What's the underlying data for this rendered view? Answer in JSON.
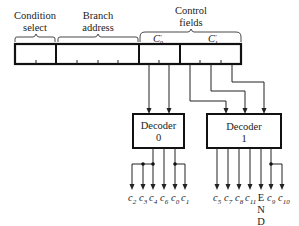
{
  "diagram": {
    "fields": {
      "condition_select": {
        "line1": "Condition",
        "line2": "select"
      },
      "branch_address": {
        "line1": "Branch",
        "line2": "address"
      },
      "control_fields": {
        "line1": "Control",
        "line2": "fields"
      },
      "c0_label": "C",
      "c0_prime": "'",
      "c0_sub": "0",
      "c1_label": "C",
      "c1_prime": "'",
      "c1_sub": "1"
    },
    "decoders": [
      {
        "line1": "Decoder",
        "line2": "0"
      },
      {
        "line1": "Decoder",
        "line2": "1"
      }
    ],
    "decoder0_outputs": [
      {
        "base": "c",
        "sub": "2"
      },
      {
        "base": "c",
        "sub": "3"
      },
      {
        "base": "c",
        "sub": "4"
      },
      {
        "base": "c",
        "sub": "6"
      },
      {
        "base": "c",
        "sub": "0"
      },
      {
        "base": "c",
        "sub": "1"
      }
    ],
    "decoder1_outputs": [
      {
        "base": "c",
        "sub": "5"
      },
      {
        "base": "c",
        "sub": "7"
      },
      {
        "base": "c",
        "sub": "8"
      },
      {
        "base": "c",
        "sub": "11"
      },
      {
        "base": "E",
        "sub": ""
      },
      {
        "base": "c",
        "sub": "9"
      },
      {
        "base": "c",
        "sub": "10"
      }
    ],
    "end_label_rest": [
      "N",
      "D"
    ]
  }
}
